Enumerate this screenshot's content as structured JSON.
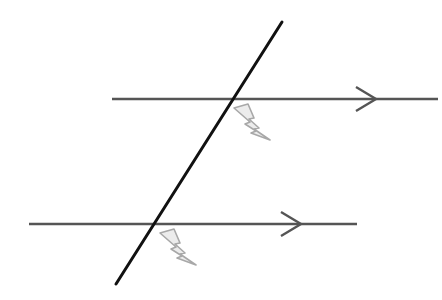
{
  "diagram": {
    "colors": {
      "background": "#ffffff",
      "parallel_line": "#555555",
      "transversal": "#111111",
      "angle_marker_stroke": "#a8a8a8",
      "angle_marker_fill": "#ececec"
    },
    "parallel_lines": [
      {
        "id": "top",
        "x1": 112,
        "y1": 99,
        "x2": 438,
        "y2": 99,
        "arrow_tip_x": 376,
        "arrow_tip_y": 99
      },
      {
        "id": "bottom",
        "x1": 29,
        "y1": 224,
        "x2": 357,
        "y2": 224,
        "arrow_tip_x": 301,
        "arrow_tip_y": 224
      }
    ],
    "transversal": {
      "x1": 282,
      "y1": 22,
      "x2": 116,
      "y2": 284
    },
    "angle_markers": [
      {
        "id": "top-intersection",
        "icon": "lightning-bolt-icon",
        "x": 234,
        "y": 104
      },
      {
        "id": "bottom-intersection",
        "icon": "lightning-bolt-icon",
        "x": 160,
        "y": 229
      }
    ]
  }
}
